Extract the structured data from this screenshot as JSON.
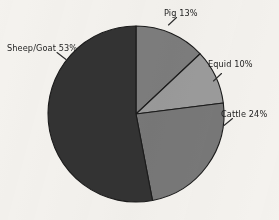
{
  "chart_data": {
    "type": "pie",
    "title": "",
    "subtitle": "",
    "xlabel": "",
    "ylabel": "",
    "legend_position": "none",
    "grid": false,
    "labels_outside": true,
    "leader_lines": true,
    "start_angle_deg": 0,
    "direction": "clockwise",
    "categories": [
      "Pig",
      "Equid",
      "Cattle",
      "Sheep/Goat"
    ],
    "values": [
      13,
      10,
      24,
      53
    ],
    "unit": "%",
    "slices": [
      {
        "name": "Pig",
        "value": 13,
        "label": "Pig 13%",
        "color": "#7d7d7d",
        "start_deg": 0,
        "end_deg": 46.8
      },
      {
        "name": "Equid",
        "value": 10,
        "label": "Equid 10%",
        "color": "#9b9b9b",
        "start_deg": 46.8,
        "end_deg": 82.8
      },
      {
        "name": "Cattle",
        "value": 24,
        "label": "Cattle 24%",
        "color": "#787878",
        "start_deg": 82.8,
        "end_deg": 169.2
      },
      {
        "name": "Sheep/Goat",
        "value": 53,
        "label": "Sheep/Goat 53%",
        "color": "#333333",
        "start_deg": 169.2,
        "end_deg": 360
      }
    ],
    "background_color": "#f4f2ee",
    "outline_color": "#1b1b1b"
  }
}
